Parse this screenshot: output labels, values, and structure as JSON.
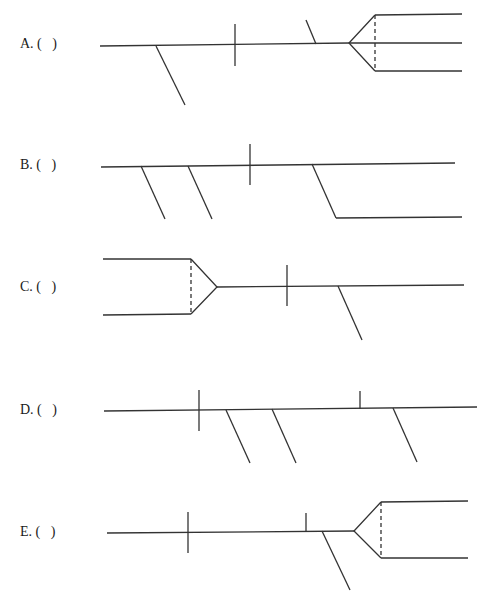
{
  "options": [
    {
      "id": "A",
      "label": "A. (   )"
    },
    {
      "id": "B",
      "label": "B. (   )"
    },
    {
      "id": "C",
      "label": "C. (   )"
    },
    {
      "id": "D",
      "label": "D. (   )"
    },
    {
      "id": "E",
      "label": "E. (   )"
    }
  ],
  "colors": {
    "line": "#333333",
    "background": "#ffffff",
    "text": "#1a1a1a"
  }
}
